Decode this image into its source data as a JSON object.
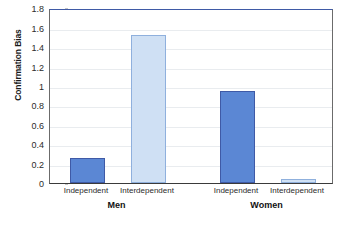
{
  "chart_data": {
    "type": "bar",
    "title": "",
    "subtitle": "",
    "xlabel": "",
    "ylabel": "Confirmation Bias",
    "ylim": [
      0,
      1.8
    ],
    "grid": true,
    "legend": false,
    "legend_position": "none",
    "categories": [
      "Independent",
      "Interdependent",
      "Independent",
      "Interdependent"
    ],
    "groups": [
      "Men",
      "Women"
    ],
    "values": [
      0.26,
      1.53,
      0.95,
      0.04
    ],
    "y_ticks": [
      "0",
      "0.2",
      "0.4",
      "0.6",
      "0.8",
      "1",
      "1.2",
      "1.4",
      "1.6",
      "1.8"
    ],
    "y_tick_values": [
      0,
      0.2,
      0.4,
      0.6,
      0.8,
      1.0,
      1.2,
      1.4,
      1.6,
      1.8
    ],
    "bars": [
      {
        "label": "Independent",
        "group": "Men",
        "value": 0.26,
        "fill": "#5b87d4",
        "stroke": "#3f5aa6"
      },
      {
        "label": "Interdependent",
        "group": "Men",
        "value": 1.53,
        "fill": "#cfe0f4",
        "stroke": "#8fb0dd"
      },
      {
        "label": "Independent",
        "group": "Women",
        "value": 0.95,
        "fill": "#5b87d4",
        "stroke": "#3f5aa6"
      },
      {
        "label": "Interdependent",
        "group": "Women",
        "value": 0.04,
        "fill": "#cfe0f4",
        "stroke": "#8fb0dd"
      }
    ],
    "colors": {
      "independent_fill": "#5b87d4",
      "independent_stroke": "#3f5aa6",
      "interdependent_fill": "#cfe0f4",
      "interdependent_stroke": "#8fb0dd",
      "gridline": "#e9ecef",
      "axis": "#6b6b6b",
      "text": "#2b2b2b",
      "background": "#ffffff"
    }
  },
  "axes": {
    "y_title": "Confirmation Bias"
  }
}
